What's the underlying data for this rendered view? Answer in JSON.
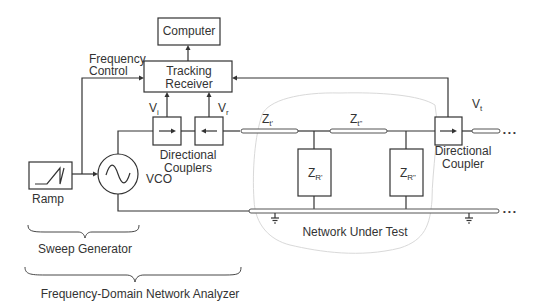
{
  "diagram": {
    "blocks": {
      "computer": "Computer",
      "tracking_receiver_line1": "Tracking",
      "tracking_receiver_line2": "Receiver",
      "ramp": "Ramp",
      "vco": "VCO"
    },
    "labels": {
      "frequency_control_line1": "Frequency",
      "frequency_control_line2": "Control",
      "vi_main": "V",
      "vi_sub": "i",
      "vr_main": "V",
      "vr_sub": "r",
      "vt_main": "V",
      "vt_sub": "t",
      "couplers_line1": "Directional",
      "couplers_line2": "Couplers",
      "coupler_line1": "Directional",
      "coupler_line2": "Coupler",
      "zt1_main": "Z",
      "zt1_sub": "t'",
      "zt2_main": "Z",
      "zt2_sub": "t\"",
      "zr1_main": "Z",
      "zr1_sub": "R'",
      "zr2_main": "Z",
      "zr2_sub": "R\"",
      "network_under_test": "Network Under Test",
      "continuation": "• • •"
    },
    "groups": {
      "sweep_generator": "Sweep Generator",
      "network_analyzer": "Frequency-Domain Network Analyzer"
    }
  }
}
